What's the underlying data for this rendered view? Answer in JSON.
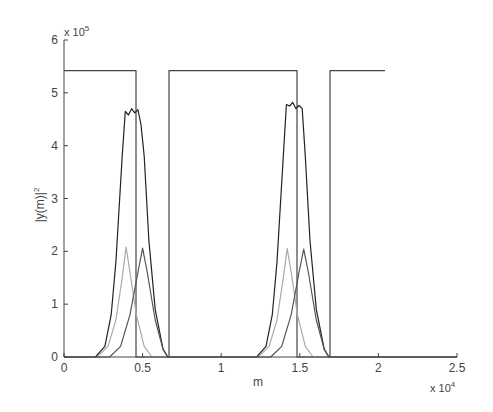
{
  "chart_data": {
    "type": "line",
    "title": "",
    "xlabel": "m",
    "ylabel": "|y(m)|^2",
    "x_multiplier": "x 10^4",
    "y_multiplier": "x 10^5",
    "xlim": [
      0,
      25000
    ],
    "ylim": [
      0,
      600000
    ],
    "x_ticks": [
      0,
      5000,
      10000,
      15000,
      20000,
      25000
    ],
    "x_tick_labels": [
      "0",
      "0.5",
      "1",
      "1.5",
      "2",
      "2.5"
    ],
    "y_ticks": [
      0,
      100000,
      200000,
      300000,
      400000,
      500000,
      600000
    ],
    "y_tick_labels": [
      "0",
      "1",
      "2",
      "3",
      "4",
      "5",
      "6"
    ],
    "grid": false,
    "legend": null,
    "series": [
      {
        "name": "rectangular window",
        "color": "#444444",
        "x": [
          0,
          4580,
          4580,
          6680,
          6680,
          14820,
          14820,
          16920,
          16920,
          20420
        ],
        "y": [
          542000,
          542000,
          0,
          0,
          542000,
          542000,
          0,
          0,
          542000,
          542000
        ]
      },
      {
        "name": "combined envelope",
        "color": "#222222",
        "x": [
          0,
          2000,
          2600,
          3000,
          3300,
          3700,
          3900,
          4100,
          4300,
          4500,
          4700,
          4900,
          5100,
          5400,
          5800,
          6300,
          6600,
          7000,
          12250,
          12850,
          13250,
          13550,
          13950,
          14150,
          14350,
          14550,
          14750,
          14950,
          15150,
          15350,
          15650,
          16050,
          16550,
          16850,
          17250,
          25000
        ],
        "y": [
          0,
          0,
          20000,
          80000,
          180000,
          380000,
          465000,
          458000,
          470000,
          462000,
          468000,
          440000,
          380000,
          220000,
          90000,
          15000,
          0,
          0,
          0,
          20000,
          80000,
          180000,
          380000,
          478000,
          475000,
          482000,
          470000,
          476000,
          470000,
          380000,
          220000,
          90000,
          15000,
          0,
          0,
          0
        ]
      },
      {
        "name": "component 1",
        "color": "#aaaaaa",
        "x": [
          0,
          2100,
          2800,
          3300,
          3700,
          3950,
          4200,
          4600,
          5100,
          5600,
          7000,
          12350,
          13050,
          13550,
          13950,
          14200,
          14450,
          14850,
          15350,
          15850,
          25000
        ],
        "y": [
          0,
          0,
          20000,
          70000,
          150000,
          208000,
          160000,
          80000,
          20000,
          0,
          0,
          0,
          20000,
          70000,
          150000,
          205000,
          160000,
          80000,
          20000,
          0,
          0
        ]
      },
      {
        "name": "component 2",
        "color": "#555555",
        "x": [
          0,
          2900,
          3600,
          4200,
          4700,
          5000,
          5300,
          5800,
          6300,
          6600,
          12000,
          13150,
          13850,
          14450,
          14950,
          15250,
          15550,
          16050,
          16550,
          16850,
          25000
        ],
        "y": [
          0,
          0,
          20000,
          80000,
          160000,
          206000,
          160000,
          70000,
          15000,
          0,
          0,
          0,
          20000,
          80000,
          160000,
          204000,
          160000,
          70000,
          15000,
          0,
          0
        ]
      }
    ]
  }
}
